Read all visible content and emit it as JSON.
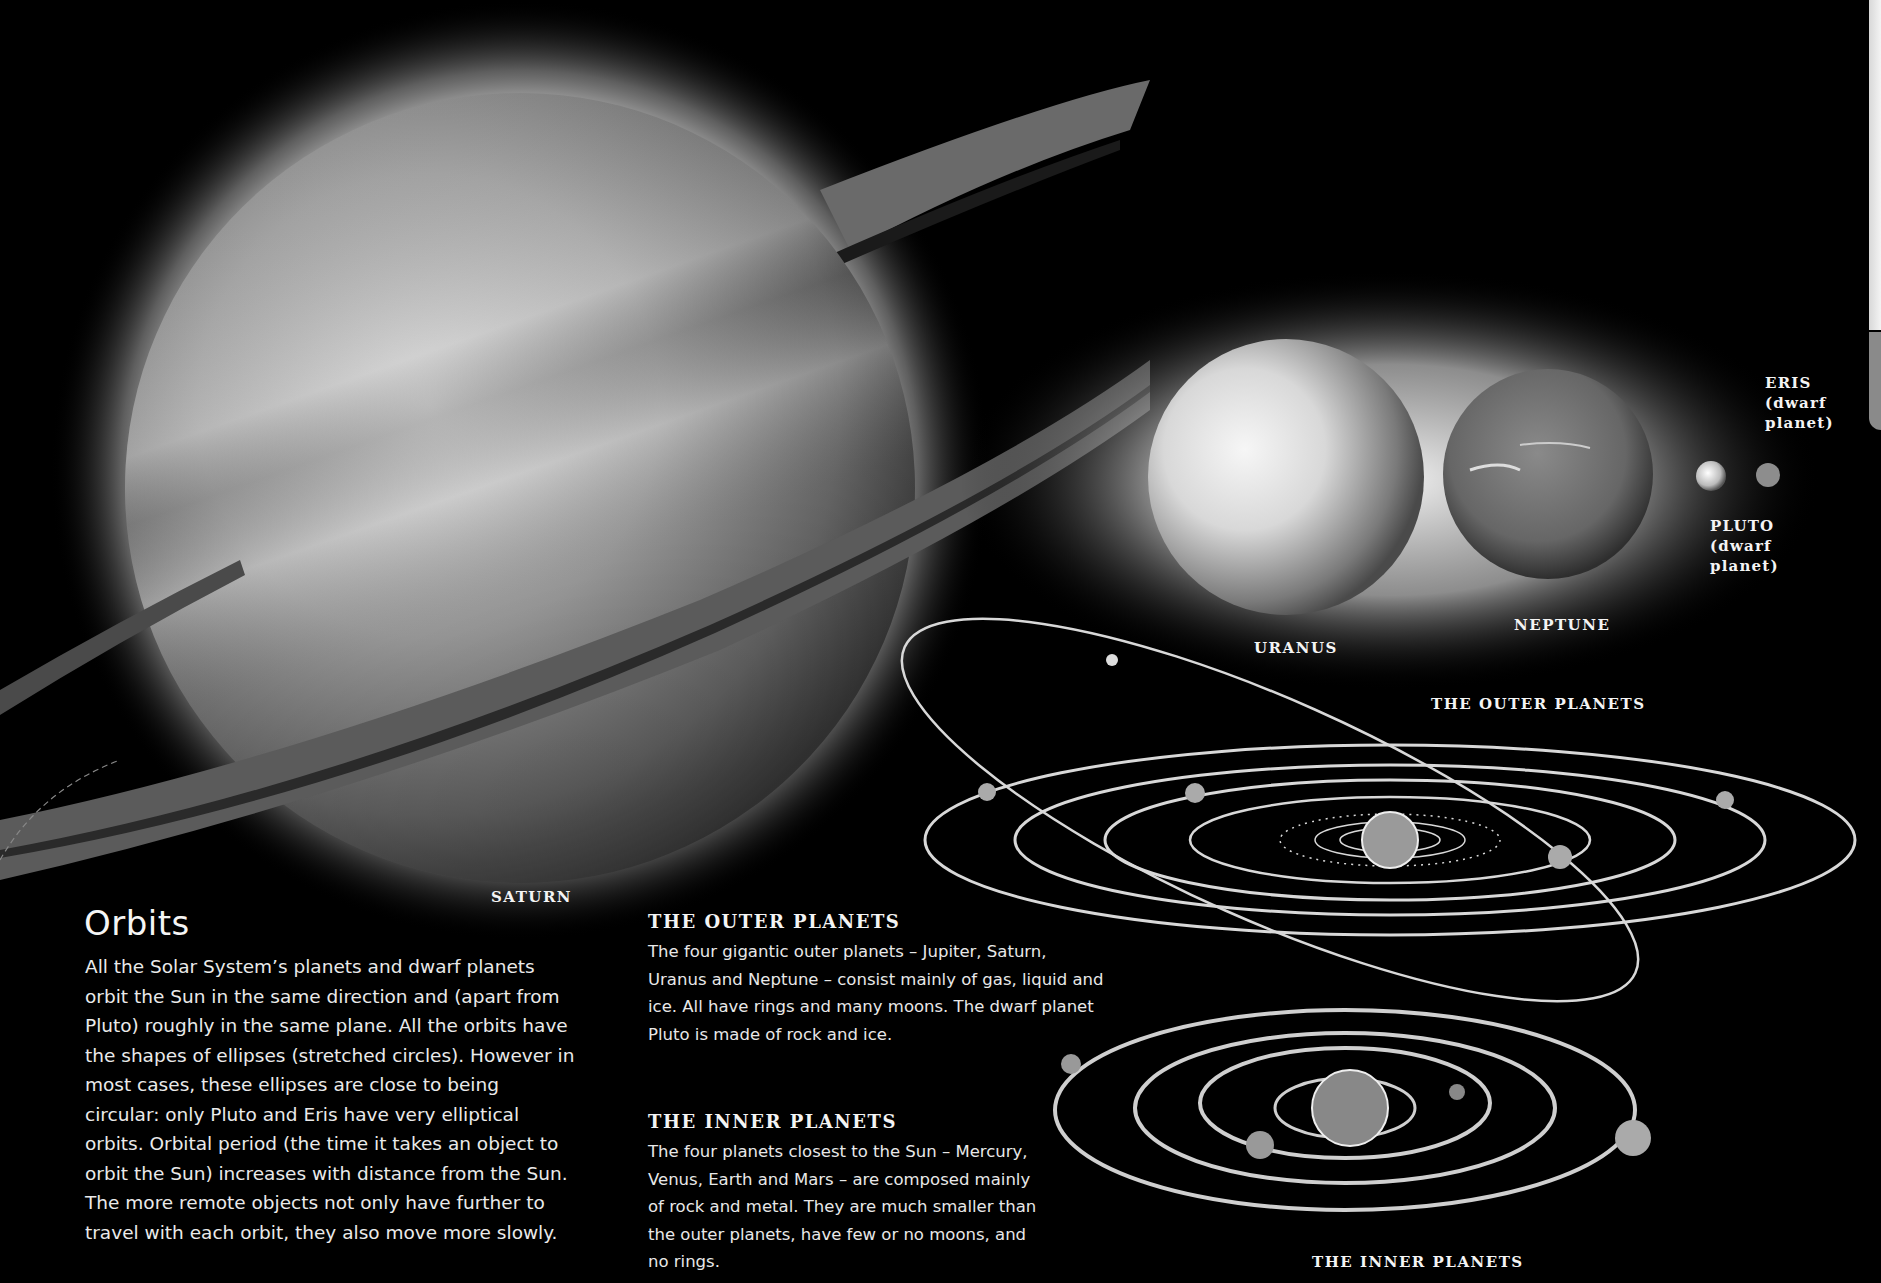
{
  "planet_labels": {
    "saturn": "SATURN",
    "uranus": "URANUS",
    "neptune": "NEPTUNE",
    "eris": "ERIS\n(dwarf\nplanet)",
    "pluto": "PLUTO\n(dwarf\nplanet)"
  },
  "diagram_labels": {
    "outer": "THE OUTER PLANETS",
    "inner": "THE INNER PLANETS"
  },
  "article": {
    "title": "Orbits",
    "body": "All the Solar System’s planets and dwarf planets orbit the Sun in the same direction and (apart from Pluto) roughly in the same plane. All the orbits have the shapes of ellipses (stretched circles). However in most cases, these ellipses are close to being circular: only Pluto and Eris have very elliptical orbits. Orbital period (the time it takes an object to orbit the Sun) increases with distance from the Sun. The more remote objects not only have further to travel with each orbit, they also move more slowly."
  },
  "sections": [
    {
      "heading": "THE OUTER PLANETS",
      "text": "The four gigantic outer planets – Jupiter, Saturn, Uranus and Neptune – consist mainly of gas, liquid and ice. All have rings and many moons. The dwarf planet Pluto is made of rock and ice."
    },
    {
      "heading": "THE INNER PLANETS",
      "text": "The four planets closest to the Sun – Mercury, Venus, Earth and Mars – are composed mainly of rock and metal. They are much smaller than the outer planets, have few or no moons, and no rings."
    }
  ]
}
